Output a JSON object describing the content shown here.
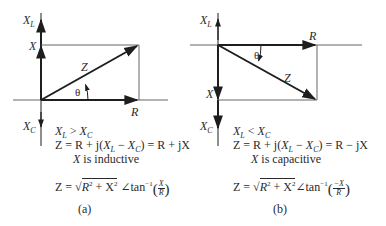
{
  "figure": {
    "panels": [
      {
        "id": "a",
        "caption": "(a)",
        "axis_labels": {
          "xl": "X",
          "xl_sub": "L",
          "xc": "X",
          "xc_sub": "C",
          "x": "X",
          "r": "R",
          "z": "Z",
          "theta": "θ"
        },
        "condition": {
          "lhs": "X",
          "lhs_sub": "L",
          "op": " > ",
          "rhs": "X",
          "rhs_sub": "C"
        },
        "impedance_eq": {
          "prefix": "Z = R + j(",
          "xl": "X",
          "xl_sub": "L",
          "minus": " − ",
          "xc": "X",
          "xc_sub": "C",
          "suffix": ") = R + jX"
        },
        "nature": {
          "var": "X",
          "text": " is inductive"
        },
        "polar": {
          "lhs": "Z = ",
          "radicand": "R",
          "sq1": "2",
          "plus": " + X",
          "sq2": "2",
          "angle": " ∠tan",
          "inv": "−1",
          "num": "X",
          "den": "R"
        },
        "angle_direction": "counterclockwise",
        "reactance_direction": "up"
      },
      {
        "id": "b",
        "caption": "(b)",
        "axis_labels": {
          "xl": "X",
          "xl_sub": "L",
          "xc": "X",
          "xc_sub": "C",
          "x": "X",
          "r": "R",
          "z": "Z",
          "theta": "θ"
        },
        "condition": {
          "lhs": "X",
          "lhs_sub": "L",
          "op": " < ",
          "rhs": "X",
          "rhs_sub": "C"
        },
        "impedance_eq": {
          "prefix": "Z = R + j(",
          "xl": "X",
          "xl_sub": "L",
          "minus": " − ",
          "xc": "X",
          "xc_sub": "C",
          "suffix": ") = R − jX"
        },
        "nature": {
          "var": "X",
          "text": " is capacitive"
        },
        "polar": {
          "lhs": "Z = ",
          "radicand": "R",
          "sq1": "2",
          "plus": " + X",
          "sq2": "2",
          "angle": "∠tan",
          "inv": "−1",
          "num": "−X",
          "den": "R"
        },
        "angle_direction": "clockwise",
        "reactance_direction": "down"
      }
    ],
    "colors": {
      "line": "#1e1e1e",
      "thin_line": "#555555",
      "text": "#2a2a2a"
    }
  }
}
